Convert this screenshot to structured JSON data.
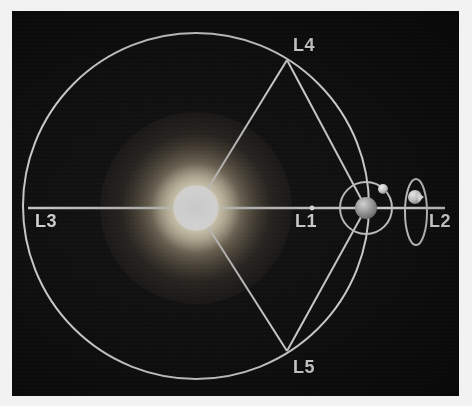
{
  "figure": {
    "background_color": "#0c0c0c",
    "frame_color": "#f2f2f2",
    "line_color": "#c9c9c9",
    "label_color": "#d8d8d8"
  },
  "bodies": {
    "sun": {
      "name": "Sun",
      "core_color": "#ffffff",
      "glow_color": "#ffeec8",
      "cx": 184,
      "cy": 197,
      "core_radius": 23,
      "glow_radius": 96
    },
    "earth": {
      "name": "Earth",
      "color": "#9a9a9a",
      "cx": 354,
      "cy": 197,
      "radius": 11
    },
    "moon": {
      "name": "Moon",
      "color": "#cfcfcf",
      "cx": 371,
      "cy": 178,
      "radius": 5
    },
    "spacecraft": {
      "name": "Spacecraft at L2",
      "color": "#cccccc",
      "cx": 403,
      "cy": 186,
      "radius": 7
    }
  },
  "orbits": {
    "earth_orbit": {
      "name": "Earth orbit around Sun",
      "cx": 184,
      "cy": 195,
      "radius": 173
    },
    "moon_orbit": {
      "name": "Moon orbit around Earth",
      "cx": 354,
      "cy": 197,
      "radius": 26
    },
    "halo_orbit": {
      "name": "L2 halo orbit",
      "cx": 404,
      "cy": 201,
      "rx": 11,
      "ry": 33
    }
  },
  "lagrange_points": [
    {
      "id": "L1",
      "label": "L1",
      "description": "Sun-Earth L1, between Sun and Earth",
      "marker_x": 300,
      "marker_y": 197,
      "label_x": 283,
      "label_y": 200
    },
    {
      "id": "L2",
      "label": "L2",
      "description": "Sun-Earth L2, beyond Earth",
      "marker_x": 404,
      "marker_y": 197,
      "label_x": 417,
      "label_y": 200
    },
    {
      "id": "L3",
      "label": "L3",
      "description": "Sun-Earth L3, opposite side of Sun",
      "marker_x": 18,
      "marker_y": 197,
      "label_x": 23,
      "label_y": 200
    },
    {
      "id": "L4",
      "label": "L4",
      "description": "Sun-Earth L4, leading 60 degrees",
      "marker_x": 275,
      "marker_y": 49,
      "label_x": 281,
      "label_y": 24
    },
    {
      "id": "L5",
      "label": "L5",
      "description": "Sun-Earth L5, trailing 60 degrees",
      "marker_x": 275,
      "marker_y": 340,
      "label_x": 281,
      "label_y": 346
    }
  ],
  "connectors": [
    {
      "name": "axis-line-L3-to-L2",
      "x1": 16,
      "y1": 197,
      "x2": 433,
      "y2": 197
    },
    {
      "name": "sun-to-L4-line",
      "x1": 184,
      "y1": 197,
      "x2": 275,
      "y2": 49
    },
    {
      "name": "sun-to-L5-line",
      "x1": 184,
      "y1": 197,
      "x2": 275,
      "y2": 340
    },
    {
      "name": "earth-to-L4-line",
      "x1": 354,
      "y1": 197,
      "x2": 275,
      "y2": 49
    },
    {
      "name": "earth-to-L5-line",
      "x1": 354,
      "y1": 197,
      "x2": 275,
      "y2": 340
    }
  ]
}
